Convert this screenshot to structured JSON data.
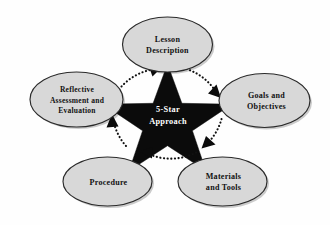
{
  "diagram": {
    "title": "5-Star Approach",
    "type": "cycle-diagram",
    "background_color": "#ffffff",
    "center": {
      "shape": "star",
      "points": 5,
      "fill_color": "#0b0b0b",
      "label_line1": "5-Star",
      "label_line2": "Approach",
      "label_color": "#ffffff"
    },
    "node_fill_color": "#d8d8d8",
    "node_stroke_color": "#2a2a2a",
    "arrow_color": "#111111",
    "arrow_style": "dotted-clockwise",
    "nodes": [
      {
        "id": "lesson-description",
        "position": "top",
        "lines": [
          "Lesson",
          "Description"
        ]
      },
      {
        "id": "goals-and-objectives",
        "position": "right",
        "lines": [
          "Goals and",
          "Objectives"
        ]
      },
      {
        "id": "materials-and-tools",
        "position": "bottom-right",
        "lines": [
          "Materials",
          "and Tools"
        ]
      },
      {
        "id": "procedure",
        "position": "bottom-left",
        "lines": [
          "Procedure"
        ]
      },
      {
        "id": "reflective-assessment-and-evaluation",
        "position": "left",
        "lines": [
          "Reflective",
          "Assessment and",
          "Evaluation"
        ]
      }
    ]
  }
}
